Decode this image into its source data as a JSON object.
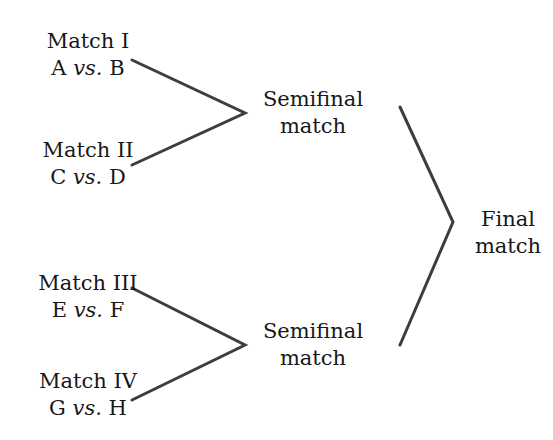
{
  "diagram": {
    "type": "tournament-bracket",
    "title": "",
    "background_color": "#ffffff",
    "line_color": "#3d3d3d",
    "text_color": "#171717",
    "rounds": [
      {
        "name": "first-round",
        "matches": [
          {
            "id": "match-1",
            "name": "Match I",
            "competitors": "A vs. B",
            "left": "A",
            "vs": "vs.",
            "right": "B"
          },
          {
            "id": "match-2",
            "name": "Match II",
            "competitors": "C vs. D",
            "left": "C",
            "vs": "vs.",
            "right": "D"
          },
          {
            "id": "match-3",
            "name": "Match III",
            "competitors": "E vs. F",
            "left": "E",
            "vs": "vs.",
            "right": "F"
          },
          {
            "id": "match-4",
            "name": "Match IV",
            "competitors": "G vs. H",
            "left": "G",
            "vs": "vs.",
            "right": "H"
          }
        ]
      },
      {
        "name": "semifinal-round",
        "matches": [
          {
            "id": "semifinal-1",
            "line1": "Semifinal",
            "line2": "match"
          },
          {
            "id": "semifinal-2",
            "line1": "Semifinal",
            "line2": "match"
          }
        ]
      },
      {
        "name": "final-round",
        "matches": [
          {
            "id": "final-1",
            "line1": "Final",
            "line2": "match"
          }
        ]
      }
    ],
    "connectors": [
      {
        "name": "connector-semifinal-1",
        "points": "132,60 245,113 132,165"
      },
      {
        "name": "connector-semifinal-2",
        "points": "132,288 245,345 132,400"
      },
      {
        "name": "connector-final",
        "points": "400,107 453,222 400,345"
      }
    ]
  }
}
